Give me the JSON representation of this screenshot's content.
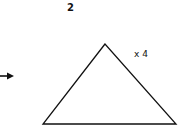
{
  "diagram": {
    "step_number": "2",
    "multiplier_label": "x 4",
    "shape": "triangle",
    "arrow": "right-arrow",
    "stroke_color": "#111111"
  }
}
